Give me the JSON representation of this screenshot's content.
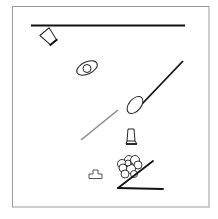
{
  "scene": {
    "title": "Physics puzzle scene",
    "colors": {
      "background": "#ffffff",
      "frame": "#9a9a9a",
      "static_bar": "#111111",
      "dynamic_outline": "#222222",
      "gray_bar": "#8c8c8c"
    },
    "objects": [
      {
        "id": "top-bar",
        "kind": "static-bar",
        "label": "Top horizontal bar"
      },
      {
        "id": "tilted-jar",
        "kind": "jar",
        "label": "Tilted jar"
      },
      {
        "id": "ellipse-with-ball",
        "kind": "ellipse",
        "label": "Ellipse with ball"
      },
      {
        "id": "diagonal-bar",
        "kind": "static-bar",
        "label": "Diagonal bar"
      },
      {
        "id": "tilted-ellipse",
        "kind": "ellipse",
        "label": "Tilted ellipse"
      },
      {
        "id": "gray-bar",
        "kind": "dynamic-bar",
        "label": "Gray diagonal bar"
      },
      {
        "id": "upright-jar",
        "kind": "jar",
        "label": "Upright jar"
      },
      {
        "id": "ball-cluster",
        "kind": "balls",
        "label": "Cluster of balls"
      },
      {
        "id": "ramp",
        "kind": "static-bar",
        "label": "Ramp"
      },
      {
        "id": "t-block",
        "kind": "block",
        "label": "Small T-shaped block"
      }
    ]
  }
}
